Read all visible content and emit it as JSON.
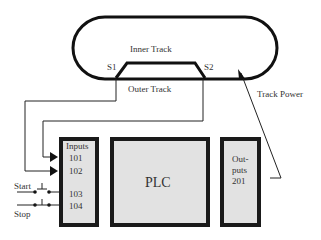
{
  "diagram": {
    "track": {
      "inner_label": "Inner Track",
      "outer_label": "Outer Track",
      "sensor1": "S1",
      "sensor2": "S2",
      "power_label": "Track Power"
    },
    "inputs": {
      "title": "Inputs",
      "addresses": [
        "101",
        "102",
        "103",
        "104"
      ]
    },
    "plc": {
      "label": "PLC"
    },
    "outputs": {
      "title_line1": "Out-",
      "title_line2": "puts",
      "address": "201"
    },
    "switches": {
      "start": "Start",
      "stop": "Stop"
    }
  }
}
